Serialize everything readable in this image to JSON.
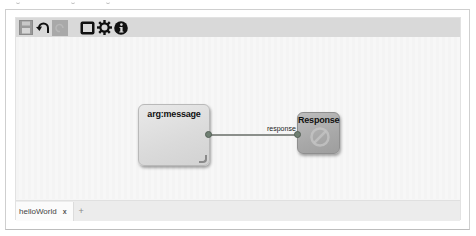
{
  "toolbar": {
    "buttons": [
      {
        "name": "save",
        "icon": "floppy-icon",
        "enabled": false
      },
      {
        "name": "undo",
        "icon": "undo-icon",
        "enabled": true
      },
      {
        "name": "redo",
        "icon": "redo-icon",
        "enabled": false
      },
      {
        "name": "toggle-view",
        "icon": "frame-icon",
        "enabled": true
      },
      {
        "name": "settings",
        "icon": "gear-icon",
        "enabled": true
      },
      {
        "name": "info",
        "icon": "info-icon",
        "enabled": true
      }
    ]
  },
  "canvas": {
    "nodes": [
      {
        "id": "arg-message",
        "title": "arg:message"
      },
      {
        "id": "response",
        "title": "Response",
        "icon": "stop-icon"
      }
    ],
    "edges": [
      {
        "from": "arg-message",
        "to": "response",
        "label": "response"
      }
    ]
  },
  "tabs": {
    "items": [
      {
        "label": "helloWorld",
        "close": "x",
        "active": true
      }
    ],
    "add_label": "+"
  },
  "colors": {
    "toolbar_bg": "#d9d9d9",
    "canvas_bg": "#f7f7f7",
    "port": "#6f7f72",
    "edge": "#8b8f8b"
  }
}
